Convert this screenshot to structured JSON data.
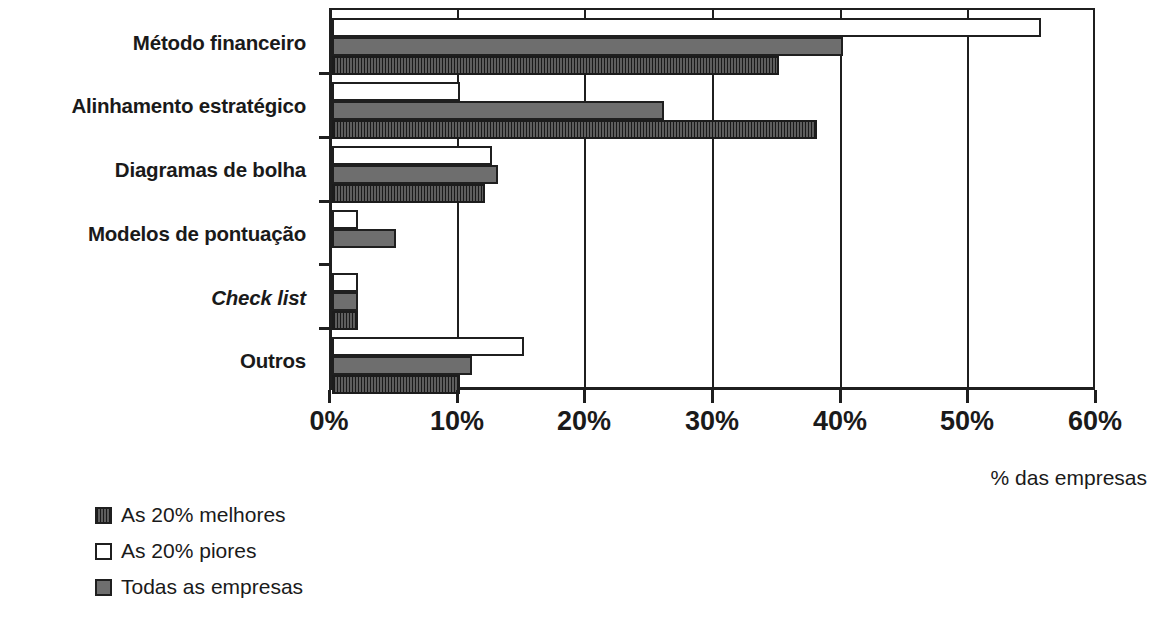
{
  "chart_data": {
    "type": "bar",
    "orientation": "horizontal",
    "title": "",
    "xlabel": "% das empresas",
    "ylabel": "",
    "xlim": [
      0,
      60
    ],
    "xticks": [
      0,
      10,
      20,
      30,
      40,
      50,
      60
    ],
    "xtick_labels": [
      "0%",
      "10%",
      "20%",
      "30%",
      "40%",
      "50%",
      "60%"
    ],
    "grid": true,
    "legend_position": "bottom-left",
    "categories": [
      "Método financeiro",
      "Alinhamento estratégico",
      "Diagramas de bolha",
      "Modelos de pontuação",
      "Check list",
      "Outros"
    ],
    "category_styles": [
      "normal",
      "normal",
      "normal",
      "normal",
      "italic",
      "normal"
    ],
    "series": [
      {
        "name": "As 20% piores",
        "key": "worst",
        "color": "#ffffff",
        "values": [
          55.5,
          10,
          12.5,
          2,
          2,
          15
        ]
      },
      {
        "name": "Todas as empresas",
        "key": "all",
        "color": "#6e6e6e",
        "values": [
          40,
          26,
          13,
          5,
          2,
          11
        ]
      },
      {
        "name": "As 20% melhores",
        "key": "best",
        "color": "#3a3a3a",
        "values": [
          35,
          38,
          12,
          0,
          2,
          10
        ]
      }
    ],
    "legend": [
      {
        "label": "As 20% melhores",
        "key": "best"
      },
      {
        "label": "As 20% piores",
        "key": "worst"
      },
      {
        "label": "Todas as empresas",
        "key": "all"
      }
    ]
  }
}
